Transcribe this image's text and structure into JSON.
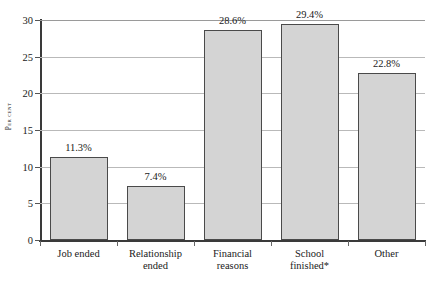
{
  "figure": {
    "title_remnant": "",
    "background": "#ffffff"
  },
  "axes": {
    "y_title": "Per cent",
    "y_ticks": [
      "0",
      "5",
      "10",
      "15",
      "20",
      "25",
      "30"
    ]
  },
  "colors": {
    "bar_fill": "#d4d4d4",
    "bar_border": "#4a4a4a",
    "gridline": "#b9b9b9",
    "axis": "#3a3a3a",
    "text": "#1a1a1a"
  },
  "bars": [
    {
      "label_line1": "Job ended",
      "label_line2": "",
      "value": 11.3,
      "value_label": "11.3%"
    },
    {
      "label_line1": "Relationship",
      "label_line2": "ended",
      "value": 7.4,
      "value_label": "7.4%"
    },
    {
      "label_line1": "Financial",
      "label_line2": "reasons",
      "value": 28.6,
      "value_label": "28.6%"
    },
    {
      "label_line1": "School",
      "label_line2": "finished*",
      "value": 29.4,
      "value_label": "29.4%"
    },
    {
      "label_line1": "Other",
      "label_line2": "",
      "value": 22.8,
      "value_label": "22.8%"
    }
  ],
  "chart_data": {
    "type": "bar",
    "title": "",
    "xlabel": "",
    "ylabel": "Per cent",
    "categories": [
      "Job ended",
      "Relationship ended",
      "Financial reasons",
      "School finished*",
      "Other"
    ],
    "values": [
      11.3,
      7.4,
      28.6,
      29.4,
      22.8
    ],
    "data_labels": [
      "11.3%",
      "7.4%",
      "28.6%",
      "29.4%",
      "22.8%"
    ],
    "ylim": [
      0,
      30
    ],
    "yticks": [
      0,
      5,
      10,
      15,
      20,
      25,
      30
    ],
    "grid": "horizontal",
    "legend": "none",
    "footnote_marker": "*",
    "units": "percent"
  }
}
